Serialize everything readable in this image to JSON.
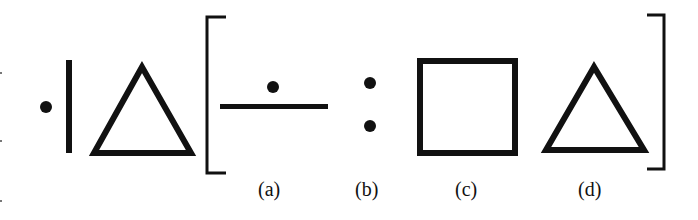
{
  "figure": {
    "type": "analogy-puzzle",
    "stem": [
      "dot",
      "vertical-line",
      "triangle"
    ],
    "options": [
      {
        "label": "(a)",
        "shape": "dot-above-horizontal-line"
      },
      {
        "label": "(b)",
        "shape": "two-vertical-dots"
      },
      {
        "label": "(c)",
        "shape": "square"
      },
      {
        "label": "(d)",
        "shape": "triangle"
      }
    ],
    "colors": {
      "ink": "#111111",
      "background": "#ffffff"
    }
  }
}
